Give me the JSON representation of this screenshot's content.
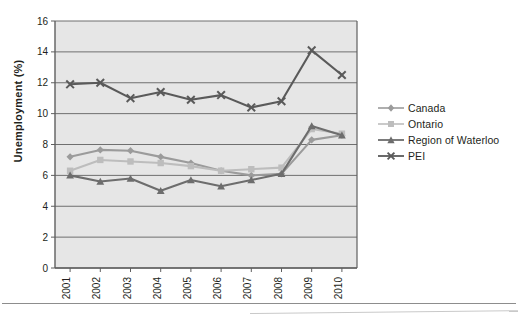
{
  "chart_data": {
    "type": "line",
    "title": "",
    "xlabel": "",
    "ylabel": "Unemployment (%)",
    "categories": [
      "2001",
      "2002",
      "2003",
      "2004",
      "2005",
      "2006",
      "2007",
      "2008",
      "2009",
      "2010"
    ],
    "ylim": [
      0,
      16
    ],
    "ytick_labels": [
      "0",
      "2",
      "4",
      "6",
      "8",
      "10",
      "12",
      "14",
      "16"
    ],
    "yticks": [
      0,
      2,
      4,
      6,
      8,
      10,
      12,
      14,
      16
    ],
    "grid": true,
    "legend_position": "right",
    "series": [
      {
        "name": "Canada",
        "marker": "diamond",
        "color": "#9b9b9b",
        "values": [
          7.2,
          7.65,
          7.6,
          7.2,
          6.8,
          6.3,
          6.0,
          6.1,
          8.3,
          8.6
        ]
      },
      {
        "name": "Ontario",
        "marker": "square",
        "color": "#bdbdbd",
        "values": [
          6.3,
          7.0,
          6.9,
          6.8,
          6.6,
          6.3,
          6.4,
          6.5,
          9.0,
          8.7
        ]
      },
      {
        "name": "Region of Waterloo",
        "marker": "triangle",
        "color": "#6d6d6d",
        "values": [
          6.0,
          5.6,
          5.8,
          5.0,
          5.7,
          5.3,
          5.7,
          6.1,
          9.2,
          8.6
        ]
      },
      {
        "name": "PEI",
        "marker": "cross",
        "color": "#5a5a5a",
        "values": [
          11.9,
          12.0,
          11.0,
          11.4,
          10.9,
          11.2,
          10.4,
          10.8,
          14.1,
          12.5
        ]
      }
    ]
  },
  "legend": {
    "items": [
      {
        "label": "Canada"
      },
      {
        "label": "Ontario"
      },
      {
        "label": "Region of Waterloo"
      },
      {
        "label": "PEI"
      }
    ]
  },
  "style": {
    "plot_background": "#e6e6e6",
    "gridline_color": "#6f6f6f",
    "frame_color": "#5f5f5f",
    "text_color": "#231f20"
  }
}
